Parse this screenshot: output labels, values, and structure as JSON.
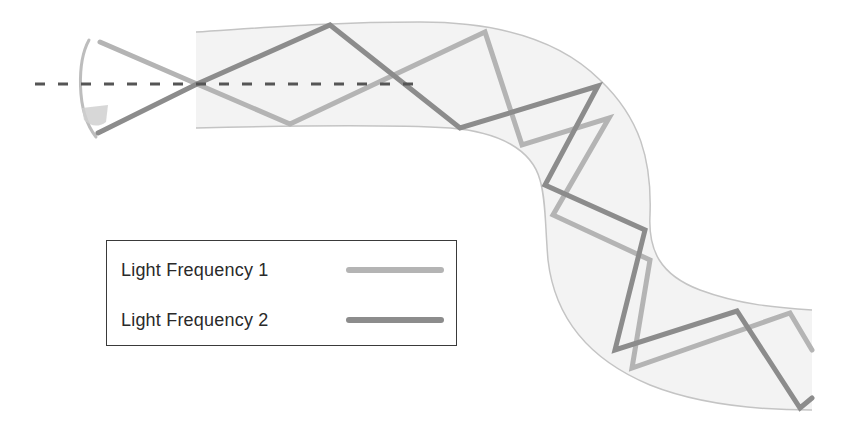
{
  "diagram": {
    "title": "",
    "colors": {
      "fiber_fill": "#f3f3f3",
      "fiber_edge": "#c4c4c4",
      "frequency_1": "#b4b4b4",
      "frequency_2": "#8c8c8c",
      "axis_dash": "#555555",
      "cone": "#bdbdbd"
    },
    "elements": {
      "optical_axis": "dashed center line",
      "acceptance_cone": "input acceptance cone at fiber entrance",
      "fiber": "curved S-shaped optical fiber"
    },
    "paths": {
      "frequency_1": [
        [
          100,
          42
        ],
        [
          197,
          84
        ],
        [
          290,
          124
        ],
        [
          485,
          32
        ],
        [
          522,
          145
        ],
        [
          609,
          118
        ],
        [
          553,
          215
        ],
        [
          650,
          260
        ],
        [
          632,
          368
        ],
        [
          790,
          313
        ],
        [
          812,
          350
        ]
      ],
      "frequency_2": [
        [
          98,
          133
        ],
        [
          197,
          84
        ],
        [
          330,
          25
        ],
        [
          460,
          128
        ],
        [
          598,
          86
        ],
        [
          545,
          185
        ],
        [
          645,
          230
        ],
        [
          615,
          350
        ],
        [
          737,
          311
        ],
        [
          800,
          408
        ],
        [
          812,
          398
        ]
      ]
    }
  },
  "legend": {
    "items": [
      {
        "label": "Light Frequency 1",
        "color": "#b4b4b4"
      },
      {
        "label": "Light Frequency 2",
        "color": "#8c8c8c"
      }
    ]
  }
}
